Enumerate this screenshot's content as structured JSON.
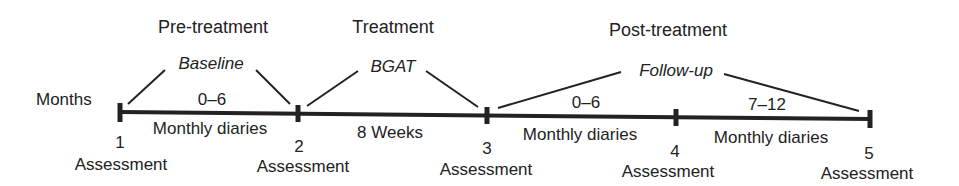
{
  "axis_label": "Months",
  "phases": [
    {
      "title": "Pre-treatment",
      "sub": "Baseline"
    },
    {
      "title": "Treatment",
      "sub": "BGAT"
    },
    {
      "title": "Post-treatment",
      "sub": "Follow-up"
    }
  ],
  "segments": [
    {
      "above": "0–6",
      "below": "Monthly diaries"
    },
    {
      "above": "",
      "below": "8 Weeks"
    },
    {
      "above": "0–6",
      "below": "Monthly diaries"
    },
    {
      "above": "7–12",
      "below": "Monthly diaries"
    }
  ],
  "assessments": [
    {
      "number": "1",
      "label": "Assessment"
    },
    {
      "number": "2",
      "label": "Assessment"
    },
    {
      "number": "3",
      "label": "Assessment"
    },
    {
      "number": "4",
      "label": "Assessment"
    },
    {
      "number": "5",
      "label": "Assessment"
    }
  ]
}
